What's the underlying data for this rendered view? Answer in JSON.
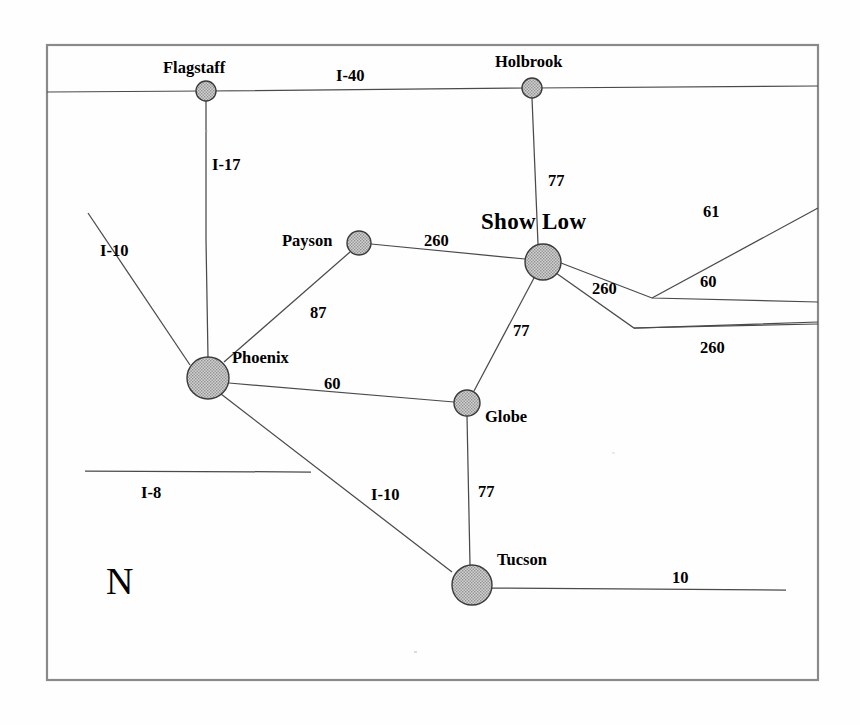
{
  "map": {
    "title": "Arizona Highway Network",
    "compass": {
      "label": "N"
    },
    "frame": {
      "x": 47,
      "y": 45,
      "width": 771,
      "height": 635,
      "color": "#8a8a8a"
    },
    "style": {
      "node_fill": "#c9c9c9",
      "node_stroke": "#3a3a3a",
      "road_color": "#4a4a4a",
      "text_color": "#000000",
      "background": "#ffffff"
    },
    "cities": [
      {
        "id": "flagstaff",
        "label": "Flagstaff",
        "x": 206,
        "y": 91,
        "r": 10,
        "label_x": 163,
        "label_y": 60,
        "emphasis": "normal"
      },
      {
        "id": "holbrook",
        "label": "Holbrook",
        "x": 532,
        "y": 88,
        "r": 10,
        "label_x": 495,
        "label_y": 54,
        "emphasis": "normal"
      },
      {
        "id": "payson",
        "label": "Payson",
        "x": 359,
        "y": 243,
        "r": 12,
        "label_x": 282,
        "label_y": 233,
        "emphasis": "normal"
      },
      {
        "id": "showlow",
        "label": "Show Low",
        "x": 543,
        "y": 262,
        "r": 18,
        "label_x": 481,
        "label_y": 210,
        "emphasis": "large"
      },
      {
        "id": "phoenix",
        "label": "Phoenix",
        "x": 208,
        "y": 378,
        "r": 21,
        "label_x": 232,
        "label_y": 350,
        "emphasis": "normal"
      },
      {
        "id": "globe",
        "label": "Globe",
        "x": 467,
        "y": 403,
        "r": 13,
        "label_x": 485,
        "label_y": 409,
        "emphasis": "normal"
      },
      {
        "id": "tucson",
        "label": "Tucson",
        "x": 472,
        "y": 585,
        "r": 20,
        "label_x": 497,
        "label_y": 552,
        "emphasis": "normal"
      }
    ],
    "roads": [
      {
        "id": "i40",
        "label": "I-40",
        "points": "47,92 206,91 532,88 818,86",
        "label_x": 336,
        "label_y": 68
      },
      {
        "id": "i17",
        "label": "I-17",
        "points": "206,101 206,240 208,357",
        "label_x": 212,
        "label_y": 157
      },
      {
        "id": "i10-northwest",
        "label": "I-10",
        "points": "88,213 190,365",
        "label_x": 100,
        "label_y": 243
      },
      {
        "id": "i10-southeast",
        "label": "I-10",
        "points": "221,394 452,572",
        "label_x": 371,
        "label_y": 487
      },
      {
        "id": "us87",
        "label": "87",
        "points": "224,362 350,252",
        "label_x": 310,
        "label_y": 305
      },
      {
        "id": "sr260-payson",
        "label": "260",
        "points": "371,244 525,259",
        "label_x": 424,
        "label_y": 233
      },
      {
        "id": "sr77-holbrook",
        "label": "77",
        "points": "532,98 538,244",
        "label_x": 548,
        "label_y": 173
      },
      {
        "id": "sr77-globe",
        "label": "77",
        "points": "534,278 474,391",
        "label_x": 513,
        "label_y": 323
      },
      {
        "id": "us60-phoenix",
        "label": "60",
        "points": "229,383 454,402",
        "label_x": 324,
        "label_y": 376
      },
      {
        "id": "sr77-tucson",
        "label": "77",
        "points": "467,416 470,565",
        "label_x": 478,
        "label_y": 484
      },
      {
        "id": "i10-tucson-east",
        "label": "10",
        "points": "492,588 786,590",
        "label_x": 672,
        "label_y": 570
      },
      {
        "id": "i8",
        "label": "I-8",
        "points": "85,471 311,472",
        "label_x": 141,
        "label_y": 485
      },
      {
        "id": "sr61",
        "label": "61",
        "points": "652,298 818,208",
        "label_x": 703,
        "label_y": 204
      },
      {
        "id": "us60-east",
        "label": "60",
        "points": "561,263 652,298 818,302",
        "label_x": 700,
        "label_y": 274
      },
      {
        "id": "sr260-showlow",
        "label": "260",
        "points": "556,273 634,328 818,322",
        "label_x": 592,
        "label_y": 281
      },
      {
        "id": "sr260-east",
        "label": "260",
        "points": "634,328 818,324",
        "label_x": 700,
        "label_y": 340
      }
    ]
  }
}
